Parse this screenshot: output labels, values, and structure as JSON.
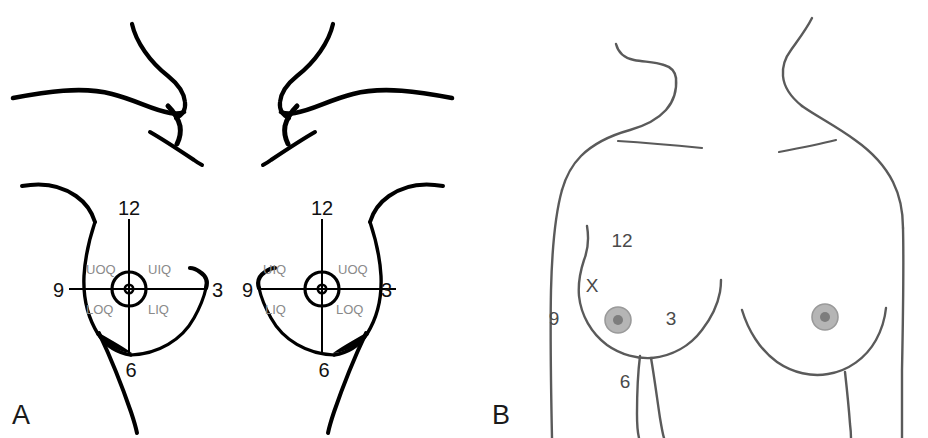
{
  "figure": {
    "panels": [
      {
        "id": "A",
        "label": "A",
        "name": "quadrant-notation-panel",
        "breasts": [
          {
            "side": "left-in-image",
            "clock": {
              "twelve": "12",
              "three": "3",
              "six": "6",
              "nine": "9"
            },
            "quadrants": {
              "upper_outer": "UOQ",
              "upper_inner": "UIQ",
              "lower_outer": "LOQ",
              "lower_inner": "LIQ"
            }
          },
          {
            "side": "right-in-image",
            "clock": {
              "twelve": "12",
              "three": "3",
              "six": "6",
              "nine": "9"
            },
            "quadrants": {
              "upper_inner": "UIQ",
              "upper_outer": "UOQ",
              "lower_inner": "LIQ",
              "lower_outer": "LOQ"
            }
          }
        ]
      },
      {
        "id": "B",
        "label": "B",
        "name": "clock-face-localization-panel",
        "breasts": [
          {
            "side": "left-in-image",
            "clock": {
              "twelve": "12",
              "three": "3",
              "six": "6",
              "nine": "9"
            },
            "lesion_mark": "X"
          },
          {
            "side": "right-in-image",
            "clock": {},
            "lesion_mark": ""
          }
        ]
      }
    ],
    "colors": {
      "background": "#ffffff",
      "ink_panel_a": "#000000",
      "ink_panel_b": "#5a5a5a",
      "quadrant_label": "#8a8a8a",
      "areola_fill": "#b5b5b5",
      "areola_stroke": "#9a9a9a",
      "nipple_fill": "#7d7d7d",
      "panel_label": "#1a1a1a"
    }
  }
}
